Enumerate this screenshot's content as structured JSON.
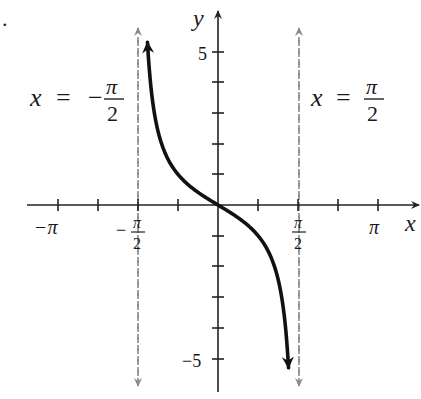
{
  "chart_data": {
    "type": "line",
    "title": "",
    "function": "y = -tan(x)",
    "xlabel": "x",
    "ylabel": "y",
    "xlim": [
      -3.6,
      4.0
    ],
    "ylim": [
      -5.6,
      6.3
    ],
    "x_ticks": [
      {
        "value": -3.14159,
        "label": "−π"
      },
      {
        "value": -2.35619,
        "label": ""
      },
      {
        "value": -1.5708,
        "label": "−π/2"
      },
      {
        "value": -0.7854,
        "label": ""
      },
      {
        "value": 0,
        "label": ""
      },
      {
        "value": 0.7854,
        "label": ""
      },
      {
        "value": 1.5708,
        "label": "π/2"
      },
      {
        "value": 2.35619,
        "label": ""
      },
      {
        "value": 3.14159,
        "label": "π"
      }
    ],
    "y_ticks": [
      {
        "value": 5,
        "label": "5"
      },
      {
        "value": 4,
        "label": ""
      },
      {
        "value": 3,
        "label": ""
      },
      {
        "value": 2,
        "label": ""
      },
      {
        "value": 1,
        "label": ""
      },
      {
        "value": -1,
        "label": ""
      },
      {
        "value": -2,
        "label": ""
      },
      {
        "value": -3,
        "label": ""
      },
      {
        "value": -4,
        "label": ""
      },
      {
        "value": -5,
        "label": "−5"
      }
    ],
    "asymptotes": [
      {
        "x": -1.5708,
        "label_lhs": "x",
        "label_eq": "=",
        "label_rhs_sign": "−",
        "label_num": "π",
        "label_den": "2"
      },
      {
        "x": 1.5708,
        "label_lhs": "x",
        "label_eq": "=",
        "label_rhs_sign": "",
        "label_num": "π",
        "label_den": "2"
      }
    ],
    "series": [
      {
        "name": "y = -tan(x)",
        "x_range": [
          -1.385,
          1.385
        ],
        "color": "#111111"
      }
    ],
    "grid": false,
    "legend": false
  },
  "labels": {
    "x_axis": "x",
    "y_axis": "y",
    "x_neg_pi": "−π",
    "x_pi": "π",
    "x_neg_half_sign": "−",
    "pi": "π",
    "two": "2",
    "y_5": "5",
    "y_neg5": "−5",
    "bullet": "."
  },
  "colors": {
    "curve": "#111111",
    "axis": "#222222",
    "asymptote": "#8a8a8a"
  }
}
